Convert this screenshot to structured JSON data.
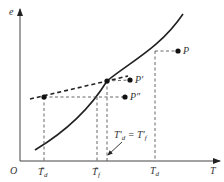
{
  "diagram": {
    "axes": {
      "y_label": "e",
      "x_label": "T",
      "origin_label": "O"
    },
    "points": [
      {
        "name": "P",
        "label": "P"
      },
      {
        "name": "P-prime",
        "label": "P′"
      },
      {
        "name": "P-double-prime",
        "label": "P″"
      }
    ],
    "x_ticks": [
      {
        "base": "T",
        "sub": "d",
        "sup": "*"
      },
      {
        "base": "T",
        "sub": "f",
        "sup": "*"
      },
      {
        "base": "T",
        "sub": "d",
        "sup": ""
      }
    ],
    "annotation": {
      "left": "T′",
      "left_sub": "d",
      "eq": " = ",
      "right": "T′",
      "right_sub": "f"
    },
    "colors": {
      "ink": "#222222",
      "background": "#ffffff"
    }
  }
}
